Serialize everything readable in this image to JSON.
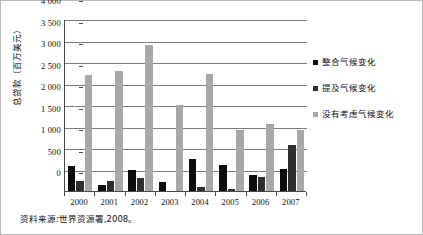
{
  "chart_data": {
    "type": "bar",
    "title": "",
    "subtitle": "",
    "xlabel": "",
    "ylabel": "总贷款（百万美元）",
    "categories": [
      "2000",
      "2001",
      "2002",
      "2003",
      "2004",
      "2005",
      "2006",
      "2007"
    ],
    "series": [
      {
        "name": "整合气候变化",
        "color": "#0d0d0d",
        "values": [
          590,
          150,
          500,
          200,
          750,
          610,
          370,
          520
        ]
      },
      {
        "name": "提及气候变化",
        "color": "#2e2e2e",
        "values": [
          240,
          240,
          300,
          0,
          100,
          55,
          320,
          1070
        ]
      },
      {
        "name": "没有考虑气候变化",
        "color": "#a8a8a8",
        "values": [
          2690,
          2800,
          3400,
          2000,
          2710,
          1420,
          1560,
          1420
        ]
      }
    ],
    "ylim": [
      0,
      4000
    ],
    "ytick_step": 500,
    "ytick_labels": [
      "4 000",
      "3 500",
      "3 000",
      "2 500",
      "2 000",
      "1 500",
      "1 000",
      "500",
      "0"
    ],
    "grid": true,
    "grid_axis": "y",
    "legend_position": "right"
  },
  "legend": {
    "items": [
      {
        "label": "整合气候变化"
      },
      {
        "label": "提及气候变化"
      },
      {
        "label": "没有考虑气候变化"
      }
    ]
  },
  "source_note": "资料来源:世界资源署,2008。"
}
